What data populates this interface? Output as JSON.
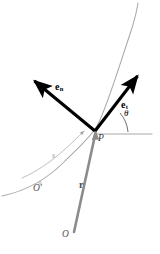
{
  "figure": {
    "width": 160,
    "height": 254,
    "background": "#ffffff"
  },
  "colors": {
    "vector_black": "#000000",
    "position_vector_gray": "#8c8c8c",
    "path_gray": "#a8a8a8",
    "arc_gray": "#b5b5b5",
    "axis_gray": "#9e9e9e",
    "label_gray": "#555555"
  },
  "labels": {
    "tangent_vector": "e",
    "tangent_subscript": "t",
    "normal_vector": "e",
    "normal_subscript": "n",
    "position_vector": "r",
    "point_p": "P",
    "origin_o": "O",
    "reference_o_prime": "O′",
    "arc_length": "s",
    "angle_theta": "θ"
  },
  "elements": [
    {
      "name": "trajectory-path",
      "type": "curve",
      "description": "Gray curved trajectory passing through point P",
      "color": "#a8a8a8"
    },
    {
      "name": "arc-length-indicator",
      "type": "arrow-arc",
      "description": "Gray arc with arrowhead measuring arc length s from O' to P",
      "color": "#b5b5b5"
    },
    {
      "name": "tangent-unit-vector",
      "type": "arrow",
      "description": "Bold black arrow tangent to path at P pointing upper-right",
      "color": "#000000"
    },
    {
      "name": "normal-unit-vector",
      "type": "arrow",
      "description": "Bold black arrow normal to path at P pointing upper-left",
      "color": "#000000"
    },
    {
      "name": "position-vector",
      "type": "arrow",
      "description": "Gray arrow from origin O to point P",
      "color": "#8c8c8c"
    },
    {
      "name": "horizontal-reference-axis",
      "type": "line",
      "description": "Gray horizontal reference line from P to the right",
      "color": "#9e9e9e"
    },
    {
      "name": "angle-arc",
      "type": "arc",
      "description": "Small arc between horizontal reference and tangent vector marking theta",
      "color": "#555555"
    }
  ],
  "geometry": {
    "point_p": [
      95,
      131
    ],
    "origin_o": [
      72,
      236
    ],
    "tangent_tip": [
      143,
      70
    ],
    "normal_tip": [
      29,
      76
    ],
    "axis_end": [
      152,
      134
    ],
    "theta_degrees": 40
  }
}
